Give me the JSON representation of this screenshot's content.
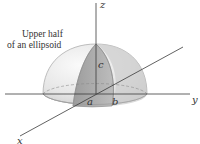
{
  "figure": {
    "caption_lines": [
      "Upper half",
      "of an ellipsoid"
    ],
    "axes": {
      "x_label": "x",
      "y_label": "y",
      "z_label": "z"
    },
    "semi_axes": {
      "a_label": "a",
      "b_label": "b",
      "c_label": "c"
    },
    "colors": {
      "axis": "#3a3a3a",
      "dome_light": "#eeeeee",
      "dome_shade": "#c4c4c4",
      "wedge": "#a9a9a9",
      "outline": "#9a9a9a"
    }
  }
}
